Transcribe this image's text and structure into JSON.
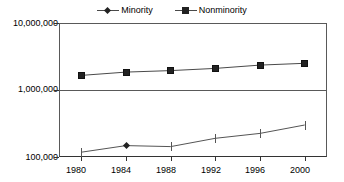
{
  "legend": {
    "position": "top-center",
    "entries": [
      {
        "label": "Minority",
        "marker": "diamond-marker-icon",
        "color": "#222222"
      },
      {
        "label": "Nonminority",
        "marker": "square-marker-icon",
        "color": "#222222"
      }
    ]
  },
  "axes": {
    "y": {
      "scale": "log",
      "ticks": [
        "100,000",
        "1,000,000",
        "10,000,000"
      ],
      "values": [
        100000,
        1000000,
        10000000
      ],
      "min": 100000,
      "max": 10000000
    },
    "x": {
      "scale": "category",
      "ticks": [
        "1980",
        "1984",
        "1988",
        "1992",
        "1996",
        "2000"
      ]
    }
  },
  "chart_data": {
    "type": "line",
    "title": "",
    "subtitle": "",
    "xlabel": "",
    "ylabel": "",
    "categories": [
      "1980",
      "1984",
      "1988",
      "1992",
      "1996",
      "2000"
    ],
    "x": [
      1980,
      1984,
      1988,
      1992,
      1996,
      2000
    ],
    "series": [
      {
        "name": "Minority",
        "marker": "diamond",
        "color": "#222222",
        "values": [
          118000,
          148000,
          143000,
          190000,
          225000,
          300000
        ]
      },
      {
        "name": "Nonminority",
        "marker": "square",
        "color": "#222222",
        "values": [
          1650000,
          1850000,
          1950000,
          2100000,
          2350000,
          2500000
        ]
      }
    ],
    "yscale": "log",
    "ylim": [
      100000,
      10000000
    ],
    "ytick_labels": [
      "100,000",
      "1,000,000",
      "10,000,000"
    ],
    "grid": true,
    "legend_position": "top-center"
  }
}
